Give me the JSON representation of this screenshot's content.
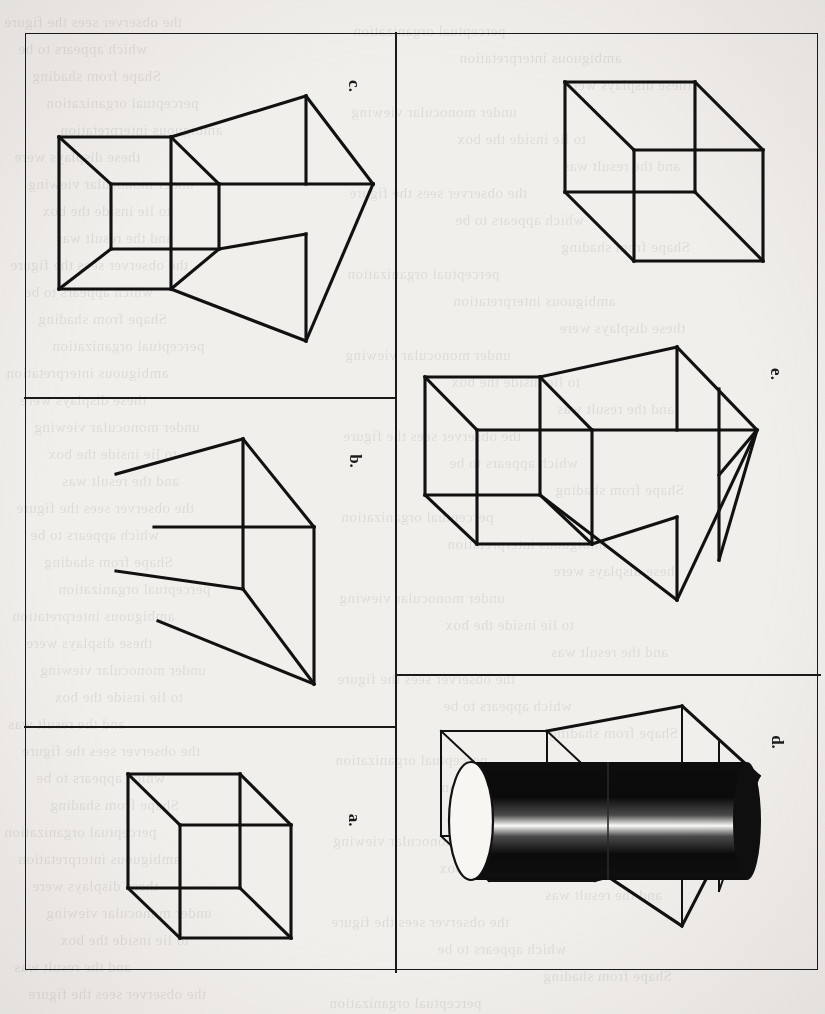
{
  "figure": {
    "kind": "line-drawing-plate",
    "orientation": "panels rotated 90 degrees clockwise on the scanned page",
    "background_color": "#f1efec",
    "ink_color": "#111111",
    "frame": {
      "x": 25,
      "y": 33,
      "width": 793,
      "height": 937,
      "border_color": "#1a1a1a"
    },
    "panels": [
      {
        "id": "c",
        "label": "c.",
        "label_position": "top-right of cell (rotated 90deg)",
        "content": "extended wireframe box: a cube at left joined to a larger tapering box at right, drawn as a transparent Necker-style frame",
        "column": "left",
        "row": 1
      },
      {
        "id": "b",
        "label": "b.",
        "label_position": "right of cell (rotated 90deg)",
        "content": "incomplete / fragmented wireframe: only some edges of the tapering box are drawn, leaving dangling line segments",
        "column": "left",
        "row": 2
      },
      {
        "id": "a",
        "label": "a.",
        "label_position": "right of cell (rotated 90deg)",
        "content": "plain transparent Necker cube",
        "column": "left",
        "row": 3
      },
      {
        "id": "unlabeled-cube",
        "label": "",
        "label_position": "none",
        "content": "plain transparent Necker cube (no caption letter)",
        "column": "right",
        "row": 1
      },
      {
        "id": "e",
        "label": "e.",
        "label_position": "right of cell (rotated 90deg)",
        "content": "extended wireframe box identical in structure to panel c, with an extra interior vertical edge at the far right face",
        "column": "right",
        "row": 1
      },
      {
        "id": "d",
        "label": "d.",
        "label_position": "right of cell (rotated 90deg)",
        "content": "same extended wireframe box as panel c, with a solid dark shaded cylinder lying inside it along its long axis; the cylinder has a pale elliptical end cap at the near-left end and a bright specular highlight band along its middle",
        "column": "right",
        "row": 2
      }
    ],
    "dividers": [
      {
        "orientation": "vertical",
        "x": 396,
        "from_y": 33,
        "to_y": 970
      },
      {
        "orientation": "horizontal",
        "y": 398,
        "from_x": 25,
        "to_x": 396
      },
      {
        "orientation": "horizontal",
        "y": 727,
        "from_x": 25,
        "to_x": 396
      },
      {
        "orientation": "horizontal",
        "y": 675,
        "from_x": 396,
        "to_x": 818
      }
    ]
  },
  "labels": {
    "a": "a.",
    "b": "b.",
    "c": "c.",
    "d": "d.",
    "e": "e."
  },
  "bleed_through_text": [
    "the observer sees the figure",
    "reversal of the depth",
    "which appears to be",
    "a transparent object",
    "Shape from shading",
    "the occluding edge",
    "perceptual organization",
    "in the image",
    "ambiguous interpretation",
    "surface orientation",
    "these displays were",
    "shown to subjects",
    "under monocular viewing",
    "the cylinder appeared",
    "to lie inside the box",
    "as in Figure 1",
    "and the result was",
    "a stable percept"
  ]
}
